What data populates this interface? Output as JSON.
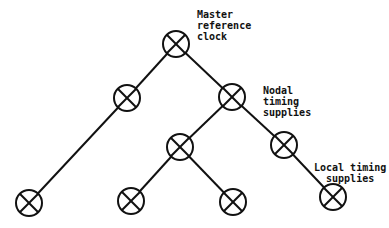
{
  "diagram": {
    "colors": {
      "line": "#111111",
      "background": "#ffffff"
    },
    "node_icon": "crossed-circle-icon",
    "labels": {
      "master": "Master\nreference\nclock",
      "nodal": "Nodal\ntiming\nsupplies",
      "local": "Local timing\n  supplies"
    },
    "nodes": [
      {
        "id": "root",
        "level": 0,
        "x": 176,
        "y": 44
      },
      {
        "id": "l1-left",
        "level": 1,
        "x": 127,
        "y": 98
      },
      {
        "id": "l1-right",
        "level": 1,
        "x": 232,
        "y": 97
      },
      {
        "id": "l2-left",
        "level": 2,
        "x": 180,
        "y": 147
      },
      {
        "id": "l2-right",
        "level": 2,
        "x": 284,
        "y": 145
      },
      {
        "id": "leaf-1",
        "level": 3,
        "x": 29,
        "y": 203
      },
      {
        "id": "leaf-2",
        "level": 3,
        "x": 131,
        "y": 201
      },
      {
        "id": "leaf-3",
        "level": 3,
        "x": 233,
        "y": 202
      },
      {
        "id": "leaf-4",
        "level": 3,
        "x": 333,
        "y": 197
      }
    ],
    "edges": [
      [
        "root",
        "l1-left"
      ],
      [
        "root",
        "l1-right"
      ],
      [
        "l1-left",
        "leaf-1"
      ],
      [
        "l1-right",
        "l2-left"
      ],
      [
        "l1-right",
        "l2-right"
      ],
      [
        "l2-left",
        "leaf-2"
      ],
      [
        "l2-left",
        "leaf-3"
      ],
      [
        "l2-right",
        "leaf-4"
      ]
    ]
  }
}
